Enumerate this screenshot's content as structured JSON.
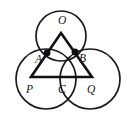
{
  "figure": {
    "background_color": "#ffffff",
    "stroke_color": "#1a1a1a",
    "triangle_color": "#111111",
    "vertex_dot_color": "#0d0d0d",
    "width": 131,
    "height": 119
  },
  "labels": {
    "top_circle_center": "O",
    "left_tangent_point": "A",
    "right_tangent_point": "B",
    "left_circle_center": "P",
    "bottom_tangent_point": "C",
    "right_circle_center": "Q"
  },
  "geometry": {
    "circles": [
      {
        "name": "circle-O",
        "label": "O",
        "cx": 61,
        "cy": 36,
        "r": 25
      },
      {
        "name": "circle-P",
        "label": "P",
        "cx": 46,
        "cy": 77,
        "r": 30
      },
      {
        "name": "circle-Q",
        "label": "Q",
        "cx": 92,
        "cy": 77,
        "r": 30
      }
    ],
    "triangle": {
      "name": "triangle-OPQ",
      "vertices": [
        {
          "label": "O",
          "x": 61,
          "y": 33
        },
        {
          "label": "P",
          "x": 31,
          "y": 77
        },
        {
          "label": "Q",
          "x": 92,
          "y": 77
        }
      ]
    },
    "marked_points": [
      {
        "label": "A",
        "x": 47,
        "y": 53
      },
      {
        "label": "B",
        "x": 75,
        "y": 52
      }
    ],
    "label_positions": [
      {
        "label": "O",
        "x": 58,
        "y": 15
      },
      {
        "label": "A",
        "x": 36,
        "y": 54
      },
      {
        "label": "B",
        "x": 78,
        "y": 53
      },
      {
        "label": "P",
        "x": 27,
        "y": 85
      },
      {
        "label": "C",
        "x": 58,
        "y": 84
      },
      {
        "label": "Q",
        "x": 87,
        "y": 85
      }
    ]
  }
}
